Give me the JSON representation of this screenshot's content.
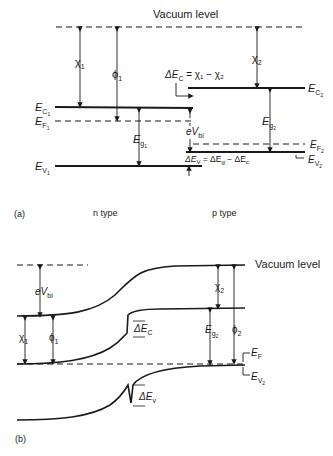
{
  "panel_a": {
    "tag": "(a)",
    "vacuum_label": "Vacuum level",
    "n_type_label": "n type",
    "p_type_label": "p type",
    "chi1": "χ",
    "chi1_sub": "1",
    "phi1": "ϕ",
    "phi1_sub": "1",
    "chi2": "χ",
    "chi2_sub": "2",
    "ec1": "E",
    "ec1_sub": "C",
    "ec1_subsub": "1",
    "ef1": "E",
    "ef1_sub": "F",
    "ef1_subsub": "1",
    "ev1": "E",
    "ev1_sub": "V",
    "ev1_subsub": "1",
    "eg1": "E",
    "eg1_sub": "g",
    "eg1_subsub": "1",
    "ec2": "E",
    "ec2_sub": "C",
    "ec2_subsub": "2",
    "ef2": "E",
    "ef2_sub": "F",
    "ef2_subsub": "2",
    "ev2": "E",
    "ev2_sub": "V",
    "ev2_subsub": "2",
    "eg2": "E",
    "eg2_sub": "g",
    "eg2_subsub": "2",
    "delta_ec_eq": "ΔE",
    "delta_ec_eq_sub": "C",
    "delta_ec_eq_rhs": " = χ₁ − χ₂",
    "evbi": "eV",
    "evbi_sub": "bi",
    "delta_ev_eq": "ΔE",
    "delta_ev_eq_sub": "V",
    "delta_ev_eq_rhs": " = ΔE",
    "delta_ev_eq_rhs_sub": "g",
    "delta_ev_eq_rhs2": " − ΔE",
    "delta_ev_eq_rhs2_sub": "c"
  },
  "panel_b": {
    "tag": "(b)",
    "vacuum_label": "Vacuum level",
    "evbi": "eV",
    "evbi_sub": "bi",
    "chi1": "χ",
    "chi1_sub": "1",
    "phi1": "ϕ",
    "phi1_sub": "1",
    "chi2": "χ",
    "chi2_sub": "2",
    "phi2": "ϕ",
    "phi2_sub": "2",
    "eg2": "E",
    "eg2_sub": "g",
    "eg2_subsub": "2",
    "ef": "E",
    "ef_sub": "F",
    "ev2": "E",
    "ev2_sub": "V",
    "ev2_subsub": "2",
    "delta_ec": "ΔE",
    "delta_ec_sub": "C",
    "delta_ev": "ΔE",
    "delta_ev_sub": "v"
  },
  "colors": {
    "line": "#1a1a1a",
    "background": "#ffffff"
  }
}
